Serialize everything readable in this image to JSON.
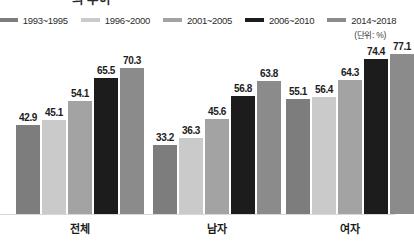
{
  "title": "의 추이",
  "unit_note": "(단위: %)",
  "legend": {
    "items": [
      {
        "label": "1993~1995",
        "color": "#7d7d7d"
      },
      {
        "label": "1996~2000",
        "color": "#cacaca"
      },
      {
        "label": "2001~2005",
        "color": "#a3a3a3"
      },
      {
        "label": "2006~2010",
        "color": "#1c1c1c"
      },
      {
        "label": "2014~2018",
        "color": "#8b8b8b"
      }
    ]
  },
  "chart_data": {
    "type": "bar",
    "title": "의 추이",
    "xlabel": "",
    "ylabel": "",
    "unit": "%",
    "ylim": [
      0,
      85
    ],
    "grid": false,
    "legend_position": "top",
    "categories": [
      "전체",
      "남자",
      "여자"
    ],
    "series": [
      {
        "name": "1993~1995",
        "color": "#7d7d7d",
        "values": [
          42.9,
          33.2,
          55.1
        ]
      },
      {
        "name": "1996~2000",
        "color": "#cacaca",
        "values": [
          45.1,
          36.3,
          56.4
        ]
      },
      {
        "name": "2001~2005",
        "color": "#a3a3a3",
        "values": [
          54.1,
          45.6,
          64.3
        ]
      },
      {
        "name": "2006~2010",
        "color": "#1c1c1c",
        "values": [
          65.5,
          56.8,
          74.4
        ]
      },
      {
        "name": "2014~2018",
        "color": "#8b8b8b",
        "values": [
          70.3,
          63.8,
          77.1
        ]
      }
    ]
  }
}
